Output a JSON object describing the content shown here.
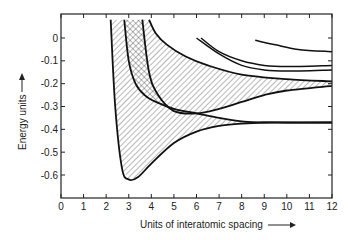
{
  "chart_data": {
    "type": "line",
    "title": "",
    "xlabel": "Units of interatomic spacing",
    "ylabel": "Energy units",
    "xlim": [
      0,
      12
    ],
    "ylim": [
      -0.7,
      0.08
    ],
    "xticks": [
      0,
      1,
      2,
      3,
      4,
      5,
      6,
      7,
      8,
      9,
      10,
      11,
      12
    ],
    "yticks": [
      0,
      -0.1,
      -0.2,
      -0.3,
      -0.4,
      -0.5,
      -0.6
    ],
    "ytick_labels": [
      "0",
      "-0.1",
      "-0.2",
      "-0.3",
      "-0.4",
      "-0.5",
      "-0.6"
    ],
    "grid": false,
    "legend": "none",
    "series": [
      {
        "name": "lower band bottom",
        "x": [
          2.2,
          2.4,
          2.7,
          3.0,
          3.4,
          4.0,
          5.0,
          6.0,
          7.0,
          8.0,
          9.0,
          10.0,
          12.0
        ],
        "y": [
          0.08,
          -0.3,
          -0.57,
          -0.62,
          -0.61,
          -0.55,
          -0.46,
          -0.41,
          -0.385,
          -0.375,
          -0.37,
          -0.37,
          -0.37
        ]
      },
      {
        "name": "lower band top",
        "x": [
          2.8,
          3.0,
          3.3,
          3.7,
          4.2,
          5.0,
          6.0,
          7.0,
          8.0,
          9.0,
          12.0
        ],
        "y": [
          0.08,
          -0.1,
          -0.2,
          -0.25,
          -0.28,
          -0.31,
          -0.33,
          -0.35,
          -0.365,
          -0.37,
          -0.37
        ]
      },
      {
        "name": "upper band bottom",
        "x": [
          3.6,
          3.9,
          4.3,
          5.0,
          6.0,
          7.0,
          8.0,
          9.0,
          10.0,
          12.0
        ],
        "y": [
          0.08,
          -0.15,
          -0.25,
          -0.32,
          -0.33,
          -0.31,
          -0.28,
          -0.25,
          -0.23,
          -0.21
        ]
      },
      {
        "name": "upper band top",
        "x": [
          3.9,
          4.2,
          4.7,
          5.5,
          6.5,
          8.0,
          10.0,
          12.0
        ],
        "y": [
          0.08,
          0.02,
          -0.03,
          -0.08,
          -0.12,
          -0.16,
          -0.18,
          -0.19
        ]
      },
      {
        "name": "curve a",
        "x": [
          6.0,
          7.0,
          8.0,
          9.0,
          10.0,
          12.0
        ],
        "y": [
          0.0,
          -0.07,
          -0.12,
          -0.14,
          -0.145,
          -0.14
        ]
      },
      {
        "name": "curve b",
        "x": [
          6.2,
          7.0,
          8.0,
          9.0,
          10.0,
          12.0
        ],
        "y": [
          0.0,
          -0.06,
          -0.1,
          -0.12,
          -0.125,
          -0.12
        ]
      },
      {
        "name": "curve c",
        "x": [
          8.6,
          9.5,
          10.5,
          12.0
        ],
        "y": [
          -0.01,
          -0.03,
          -0.05,
          -0.06
        ]
      }
    ],
    "annotations": [
      "hatched region: lower band",
      "cross-hatched: band overlap",
      "hatched region: upper band"
    ]
  },
  "axes": {
    "xlabel": "Units of interatomic spacing",
    "ylabel": "Energy units",
    "x_tick_labels": [
      "0",
      "1",
      "2",
      "3",
      "4",
      "5",
      "6",
      "7",
      "8",
      "9",
      "10",
      "11",
      "12"
    ],
    "y_tick_labels": [
      "0",
      "-0.1",
      "-0.2",
      "-0.3",
      "-0.4",
      "-0.5",
      "-0.6"
    ]
  }
}
